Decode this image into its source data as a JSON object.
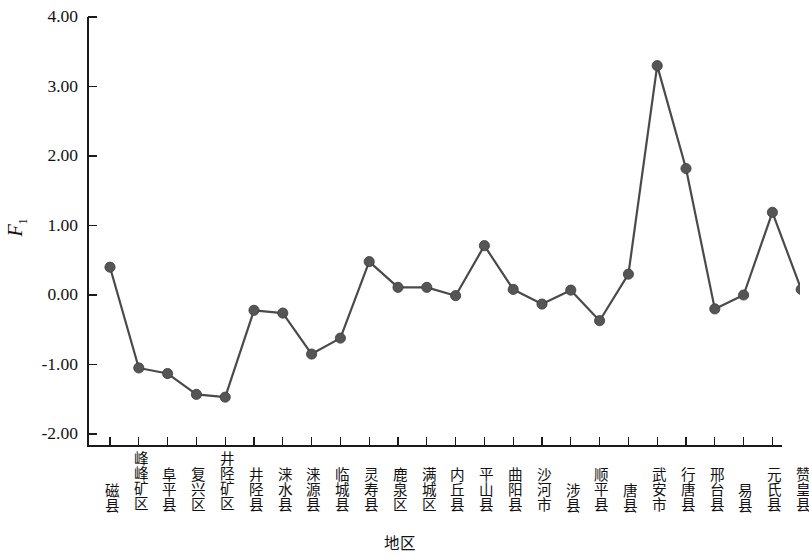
{
  "chart_data": {
    "type": "line",
    "title": "",
    "xlabel": "地区",
    "ylabel": "F1",
    "ylabel_base": "F",
    "ylabel_sub": "1",
    "ylim": [
      -2.0,
      4.0
    ],
    "ytick_labels": [
      "4.00",
      "3.00",
      "2.00",
      "1.00",
      "0.00",
      "-1.00",
      "-2.00"
    ],
    "ytick_values": [
      4.0,
      3.0,
      2.0,
      1.0,
      0.0,
      -1.0,
      -2.0
    ],
    "grid": false,
    "legend": "none",
    "marker": "filled-circle",
    "series_color": "#4a4a4a",
    "marker_color": "#555555",
    "categories": [
      "磁县",
      "峰峰矿区",
      "阜平县",
      "复兴区",
      "井陉矿区",
      "井陉县",
      "涞水县",
      "涞源县",
      "临城县",
      "灵寿县",
      "鹿泉区",
      "满城区",
      "内丘县",
      "平山县",
      "曲阳县",
      "沙河市",
      "涉县",
      "顺平县",
      "唐县",
      "武安市",
      "行唐县",
      "邢台县",
      "易县",
      "元氏县",
      "赞皇县"
    ],
    "values": [
      0.4,
      -1.05,
      -1.13,
      -1.43,
      -1.47,
      -0.22,
      -0.26,
      -0.85,
      -0.62,
      0.48,
      0.11,
      0.11,
      -0.01,
      0.71,
      0.08,
      -0.13,
      0.07,
      -0.37,
      0.3,
      3.3,
      1.82,
      -0.2,
      0.0,
      1.19,
      0.08
    ]
  }
}
